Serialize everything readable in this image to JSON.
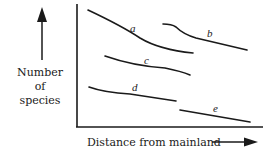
{
  "diagram": {
    "y_axis_label": [
      "Number",
      "of",
      "species"
    ],
    "x_axis_label": "Distance from mainland",
    "curves": [
      {
        "label": "a"
      },
      {
        "label": "b"
      },
      {
        "label": "c"
      },
      {
        "label": "d"
      },
      {
        "label": "e"
      }
    ]
  }
}
